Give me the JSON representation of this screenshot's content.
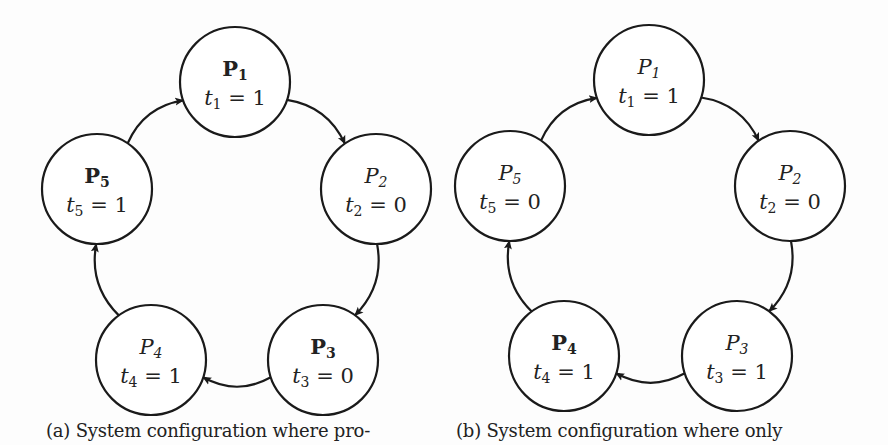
{
  "figure": {
    "colors": {
      "stroke": "#1a1a1a",
      "text": "#222222",
      "background": "#fdfdfd",
      "node_fill": "#ffffff"
    },
    "node_radius": 55,
    "subfigures": [
      {
        "id": "a",
        "caption": "(a) System configuration where pro-",
        "nodes": [
          {
            "name": "P",
            "index": "1",
            "bold": true,
            "time_var": "t",
            "time_value": "1",
            "cx": 235,
            "cy": 82
          },
          {
            "name": "P",
            "index": "2",
            "bold": false,
            "time_var": "t",
            "time_value": "0",
            "cx": 376,
            "cy": 189
          },
          {
            "name": "P",
            "index": "3",
            "bold": true,
            "time_var": "t",
            "time_value": "0",
            "cx": 323,
            "cy": 360
          },
          {
            "name": "P",
            "index": "4",
            "bold": false,
            "time_var": "t",
            "time_value": "1",
            "cx": 151,
            "cy": 360
          },
          {
            "name": "P",
            "index": "5",
            "bold": true,
            "time_var": "t",
            "time_value": "1",
            "cx": 97,
            "cy": 189
          }
        ],
        "edges": [
          {
            "from": "1",
            "to": "2"
          },
          {
            "from": "2",
            "to": "3"
          },
          {
            "from": "3",
            "to": "4"
          },
          {
            "from": "4",
            "to": "5"
          },
          {
            "from": "5",
            "to": "1"
          }
        ]
      },
      {
        "id": "b",
        "caption": "(b) System configuration where only",
        "nodes": [
          {
            "name": "P",
            "index": "1",
            "bold": false,
            "time_var": "t",
            "time_value": "1",
            "cx": 649,
            "cy": 80
          },
          {
            "name": "P",
            "index": "2",
            "bold": false,
            "time_var": "t",
            "time_value": "0",
            "cx": 790,
            "cy": 186
          },
          {
            "name": "P",
            "index": "3",
            "bold": false,
            "time_var": "t",
            "time_value": "1",
            "cx": 737,
            "cy": 356
          },
          {
            "name": "P",
            "index": "4",
            "bold": true,
            "time_var": "t",
            "time_value": "1",
            "cx": 564,
            "cy": 356
          },
          {
            "name": "P",
            "index": "5",
            "bold": false,
            "time_var": "t",
            "time_value": "0",
            "cx": 510,
            "cy": 186
          }
        ],
        "edges": [
          {
            "from": "1",
            "to": "2"
          },
          {
            "from": "2",
            "to": "3"
          },
          {
            "from": "3",
            "to": "4"
          },
          {
            "from": "4",
            "to": "5"
          },
          {
            "from": "5",
            "to": "1"
          }
        ]
      }
    ]
  }
}
